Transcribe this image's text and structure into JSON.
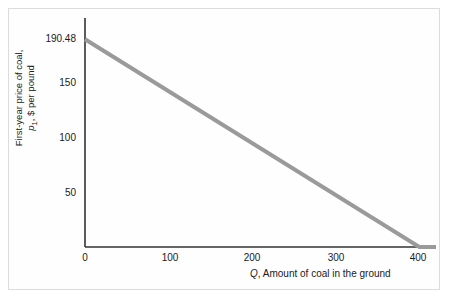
{
  "chart_data": {
    "type": "line",
    "title": "",
    "subtitle": "",
    "xlabel_prefix": "Q",
    "xlabel_rest": ", Amount of coal in the ground",
    "ylabel_line1": "First-year price of coal,",
    "ylabel_line2_prefix": "p",
    "ylabel_line2_sub": "1",
    "ylabel_line2_rest": ", $ per pound",
    "x_ticks": [
      0,
      100,
      200,
      300,
      400
    ],
    "x_tick_labels": [
      "0",
      "100",
      "200",
      "300",
      "400"
    ],
    "y_ticks": [
      0,
      50,
      100,
      150,
      190.48
    ],
    "y_tick_labels": [
      "0",
      "50",
      "100",
      "150",
      "190.48"
    ],
    "xlim": [
      0,
      420
    ],
    "ylim": [
      0,
      210
    ],
    "grid": false,
    "legend": null,
    "series": [
      {
        "name": "Demand for coal",
        "color": "#9a9a9a",
        "linewidth": 4,
        "points": [
          {
            "x": 0,
            "y": 190.48
          },
          {
            "x": 400,
            "y": 0
          },
          {
            "x": 420,
            "y": 0
          }
        ]
      }
    ],
    "annotations": [],
    "axis_color": "#333333",
    "background_color": "#ffffff",
    "frame_color": "#dcdcdc",
    "intercept_y": 190.48,
    "intercept_x": 400
  }
}
